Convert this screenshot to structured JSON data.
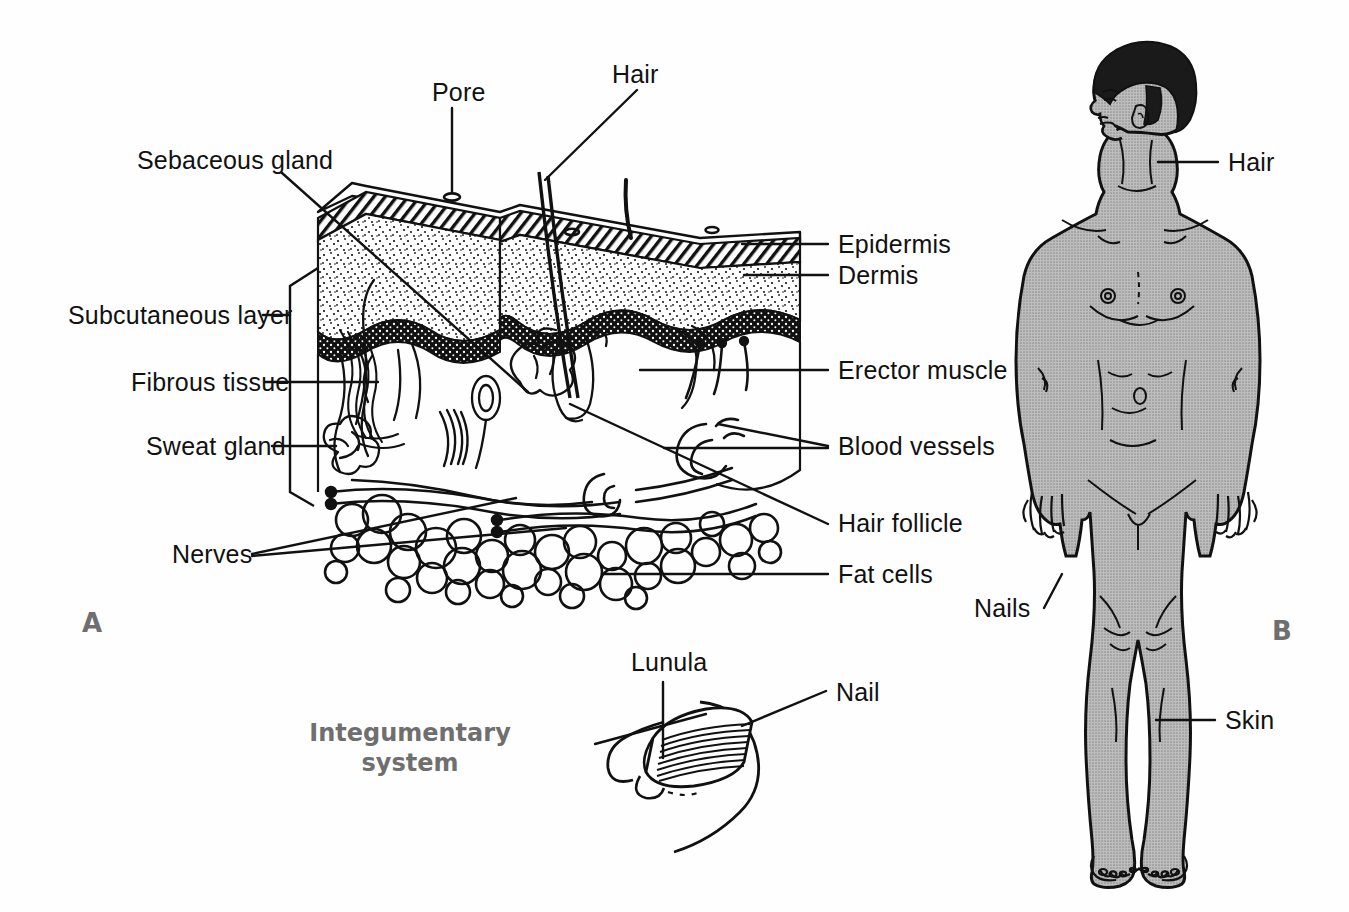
{
  "figure": {
    "title": "Integumentary system",
    "panel_a_letter": "A",
    "panel_b_letter": "B",
    "background_color": "#fefefe",
    "ink_color": "#111111",
    "title_color": "#6f6f6f",
    "skin_fill_color": "#a8a8a8",
    "hair_fill_color": "#1a1a1a"
  },
  "panel_a": {
    "name": "skin-cross-section",
    "labels": [
      {
        "id": "pore",
        "text": "Pore",
        "x": 432,
        "y": 95,
        "align": "left"
      },
      {
        "id": "hair",
        "text": "Hair",
        "x": 612,
        "y": 77,
        "align": "left"
      },
      {
        "id": "sebaceous-gland",
        "text": "Sebaceous gland",
        "x": 137,
        "y": 163,
        "align": "left"
      },
      {
        "id": "subcutaneous-layer",
        "text": "Subcutaneous layer",
        "x": 68,
        "y": 321,
        "align": "left"
      },
      {
        "id": "fibrous-tissue",
        "text": "Fibrous tissue",
        "x": 131,
        "y": 388,
        "align": "left"
      },
      {
        "id": "sweat-gland",
        "text": "Sweat gland",
        "x": 146,
        "y": 452,
        "align": "left"
      },
      {
        "id": "nerves",
        "text": "Nerves",
        "x": 172,
        "y": 560,
        "align": "left"
      },
      {
        "id": "epidermis",
        "text": "Epidermis",
        "x": 838,
        "y": 250,
        "align": "left"
      },
      {
        "id": "dermis",
        "text": "Dermis",
        "x": 838,
        "y": 281,
        "align": "left"
      },
      {
        "id": "erector-muscle",
        "text": "Erector muscle",
        "x": 838,
        "y": 377,
        "align": "left"
      },
      {
        "id": "blood-vessels",
        "text": "Blood vessels",
        "x": 838,
        "y": 452,
        "align": "left"
      },
      {
        "id": "hair-follicle",
        "text": "Hair follicle",
        "x": 838,
        "y": 530,
        "align": "left"
      },
      {
        "id": "fat-cells",
        "text": "Fat cells",
        "x": 838,
        "y": 581,
        "align": "left"
      }
    ]
  },
  "panel_nail": {
    "name": "fingernail-detail",
    "labels": [
      {
        "id": "lunula",
        "text": "Lunula",
        "x": 631,
        "y": 668,
        "align": "left"
      },
      {
        "id": "nail",
        "text": "Nail",
        "x": 836,
        "y": 709,
        "align": "left"
      }
    ]
  },
  "panel_b": {
    "name": "full-body-figure",
    "labels": [
      {
        "id": "hair-body",
        "text": "Hair",
        "x": 1228,
        "y": 169,
        "align": "left"
      },
      {
        "id": "nails-body",
        "text": "Nails",
        "x": 974,
        "y": 615,
        "align": "left"
      },
      {
        "id": "skin-body",
        "text": "Skin",
        "x": 1225,
        "y": 726,
        "align": "left"
      }
    ]
  }
}
